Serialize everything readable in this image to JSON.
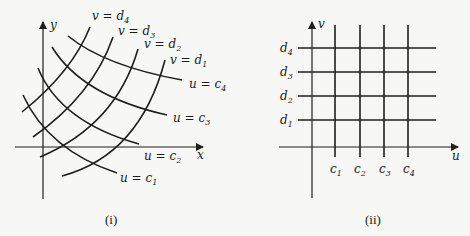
{
  "figure": {
    "panel_i": {
      "caption": "(i)",
      "x_axis_label": "x",
      "y_axis_label": "y",
      "v_curves": [
        {
          "label": "v = d",
          "sub": "4"
        },
        {
          "label": "v = d",
          "sub": "3"
        },
        {
          "label": "v = d",
          "sub": "2"
        },
        {
          "label": "v = d",
          "sub": "1"
        }
      ],
      "u_curves": [
        {
          "label": "u = c",
          "sub": "4"
        },
        {
          "label": "u = c",
          "sub": "3"
        },
        {
          "label": "u = c",
          "sub": "2"
        },
        {
          "label": "u = c",
          "sub": "1"
        }
      ]
    },
    "panel_ii": {
      "caption": "(ii)",
      "u_axis_label": "u",
      "v_axis_label": "v",
      "d_ticks": [
        {
          "label": "d",
          "sub": "4"
        },
        {
          "label": "d",
          "sub": "3"
        },
        {
          "label": "d",
          "sub": "2"
        },
        {
          "label": "d",
          "sub": "1"
        }
      ],
      "c_ticks": [
        {
          "label": "c",
          "sub": "1"
        },
        {
          "label": "c",
          "sub": "2"
        },
        {
          "label": "c",
          "sub": "3"
        },
        {
          "label": "c",
          "sub": "4"
        }
      ]
    }
  }
}
